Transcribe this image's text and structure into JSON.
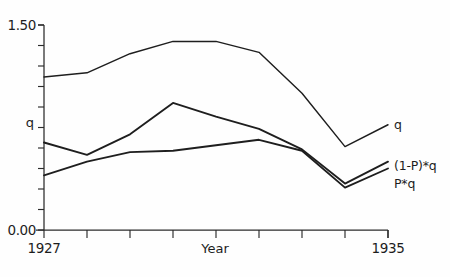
{
  "chart_data": {
    "type": "line",
    "title": "",
    "xlabel": "Year",
    "ylabel": "q",
    "x": [
      1927,
      1928,
      1929,
      1930,
      1931,
      1932,
      1933,
      1934,
      1935
    ],
    "xlim": [
      1927,
      1935
    ],
    "ylim": [
      0.0,
      1.5
    ],
    "grid": false,
    "legend_position": "right-inline",
    "y_tick_labels": [
      "0.00",
      "1.50"
    ],
    "y_axis_label_text": "q",
    "x_tick_labels": [
      "1927",
      "1935"
    ],
    "y_minor_ticks": [
      0.0,
      0.15,
      0.3,
      0.45,
      0.6,
      0.75,
      0.9,
      1.05,
      1.2,
      1.35,
      1.5
    ],
    "series": [
      {
        "name": "q",
        "label": "q",
        "values": [
          1.12,
          1.15,
          1.29,
          1.38,
          1.38,
          1.3,
          1.0,
          0.61,
          0.77
        ]
      },
      {
        "name": "(1-P)*q",
        "label": "(1-P)*q",
        "values": [
          0.64,
          0.55,
          0.7,
          0.93,
          0.83,
          0.74,
          0.59,
          0.34,
          0.5
        ]
      },
      {
        "name": "P*q",
        "label": "P*q",
        "values": [
          0.4,
          0.5,
          0.57,
          0.58,
          0.62,
          0.66,
          0.58,
          0.31,
          0.45
        ]
      }
    ]
  },
  "axes": {
    "y_top_label": "1.50",
    "y_bottom_label": "0.00",
    "y_mid_label": "q",
    "x_left_label": "1927",
    "x_right_label": "1935",
    "x_axis_title": "Year"
  },
  "labels": {
    "q": "q",
    "one_minus_p_q": "(1-P)*q",
    "p_q": "P*q"
  },
  "colors": {
    "ink": "#1d1d1d",
    "background": "#fefefe"
  }
}
